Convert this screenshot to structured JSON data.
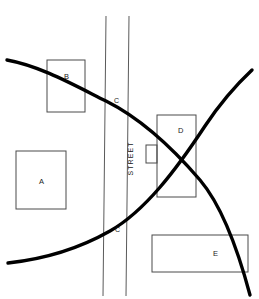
{
  "figure": {
    "name": "site-plan-map",
    "width": 259,
    "height": 299,
    "background_color": "#ffffff",
    "line_color": "#000000",
    "thin_line_color": "#5a5a5a",
    "label_color": "#1a1a1a"
  },
  "buildings": [
    {
      "id": "A",
      "label": "A",
      "x": 16,
      "y": 151,
      "width": 50,
      "height": 58,
      "label_x": 39,
      "label_y": 178
    },
    {
      "id": "B",
      "label": "B",
      "x": 47,
      "y": 60,
      "width": 38,
      "height": 52,
      "label_x": 64,
      "label_y": 73
    },
    {
      "id": "D",
      "label": "D",
      "x": 157,
      "y": 115,
      "width": 39,
      "height": 82,
      "label_x": 178,
      "label_y": 127
    },
    {
      "id": "E",
      "label": "E",
      "x": 152,
      "y": 235,
      "width": 96,
      "height": 37,
      "label_x": 213,
      "label_y": 250
    }
  ],
  "annex": {
    "name": "building-d-annex",
    "x": 146,
    "y": 145,
    "width": 11,
    "height": 18
  },
  "street": {
    "label": "STREET",
    "label_x": 113,
    "label_y": 155,
    "left_edge_x_top": 106,
    "left_edge_x_bottom": 103,
    "right_edge_x_top": 129,
    "right_edge_x_bottom": 126,
    "y_top": 16,
    "y_bottom": 296
  },
  "contours": [
    {
      "id": "C-upper",
      "label": "C",
      "label_x": 114,
      "label_y": 97,
      "path": "M 7,60 C 40,66 72,84 106,101 C 140,118 170,145 200,180 C 222,206 238,250 250,295",
      "stroke_width": 3.4
    },
    {
      "id": "C-lower",
      "label": "C",
      "label_x": 115,
      "label_y": 226,
      "path": "M 8,263 C 45,259 80,248 110,231 C 145,211 176,170 205,126 C 219,105 236,85 252,70",
      "stroke_width": 3.4
    }
  ],
  "legend_letters": [
    "A",
    "B",
    "C",
    "D",
    "E"
  ]
}
